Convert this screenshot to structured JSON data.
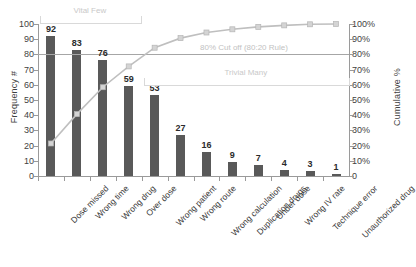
{
  "chart_data": {
    "type": "bar",
    "title": "",
    "subtitle": "",
    "xlabel": "",
    "ylabel": "Frequency #",
    "y2label": "Cumulative %",
    "ylim": [
      0,
      100
    ],
    "y2lim": [
      0,
      100
    ],
    "grid": false,
    "legend": "none",
    "categories": [
      "Dose missed",
      "Wrong time",
      "Wrong drug",
      "Over dose",
      "Wrong patient",
      "Wrong route",
      "Wrong calculation",
      "Duplication drugs",
      "Under dose",
      "Wrong IV rate",
      "Technique error",
      "Unauthorized drug"
    ],
    "values": [
      92,
      83,
      76,
      59,
      53,
      27,
      16,
      9,
      7,
      4,
      3,
      1
    ],
    "series": [
      {
        "name": "Frequency #",
        "type": "bar",
        "axis": "left",
        "values": [
          92,
          83,
          76,
          59,
          53,
          27,
          16,
          9,
          7,
          4,
          3,
          1
        ]
      },
      {
        "name": "Cumulative %",
        "type": "line",
        "axis": "right",
        "values": [
          21.4,
          40.7,
          58.4,
          72.1,
          84.4,
          90.7,
          94.4,
          96.5,
          98.1,
          99.1,
          99.8,
          100.0
        ]
      }
    ],
    "total": 430,
    "y_ticks": [
      "100",
      "90",
      "80",
      "70",
      "60",
      "50",
      "40",
      "30",
      "20",
      "10",
      "0"
    ],
    "y2_ticks": [
      "100%",
      "90%",
      "80%",
      "70%",
      "60%",
      "50%",
      "40%",
      "30%",
      "20%",
      "10%",
      "0"
    ],
    "annotations": [
      {
        "id": "cutoff",
        "text": "80% Cut off (80:20 Rule)",
        "value": 80
      },
      {
        "id": "vital-few",
        "text": "Vital Few",
        "span": [
          0,
          3
        ]
      },
      {
        "id": "trivial-many",
        "text": "Trivial Many",
        "span": [
          4,
          11
        ]
      }
    ],
    "colors": {
      "bar": "#595959",
      "line": "#bfbfbf",
      "marker": "#d4d4d4",
      "cutoff": "#a6a6a6",
      "bracket": "#d9d9d9",
      "axis": "#9a9a9a",
      "text": "#3f3f3f",
      "background": "#ffffff"
    }
  }
}
